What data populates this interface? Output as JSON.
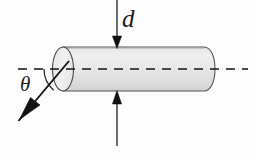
{
  "figure": {
    "background_color": "#fdfdfd",
    "width": 257,
    "height": 158
  },
  "labels": {
    "diameter": "d",
    "angle": "θ"
  },
  "icons": {
    "down_arrow": "arrow-down-icon",
    "up_arrow": "arrow-up-icon",
    "diagonal_arrow": "arrow-diagonal-icon",
    "axis": "dashed-axis-line-icon",
    "angle_arc": "angle-arc-icon",
    "cylinder": "cylinder-shape-icon"
  },
  "colors": {
    "stroke": "#1b1b1b",
    "cylinder_fill_light": "#eeeeee",
    "cylinder_fill_mid": "#e2e2e2",
    "cylinder_fill_dark": "#d3d3d3",
    "cap_fill": "#ededed",
    "background": "#fdfdfd"
  },
  "geometry": {
    "axis_y": 69,
    "axis_x_start": 18,
    "axis_x_end": 248,
    "cylinder_left_x": 53,
    "cylinder_right_x": 214,
    "cylinder_top_y": 47,
    "cylinder_bottom_y": 91,
    "cap_center_x": 63,
    "cap_rx": 10,
    "cap_ry": 22,
    "top_arrow_x": 117,
    "top_arrow_y_start": 0,
    "top_arrow_y_end": 47,
    "bottom_arrow_x": 117,
    "bottom_arrow_y_start": 145,
    "bottom_arrow_y_end": 92,
    "diagonal_start_x": 68,
    "diagonal_start_y": 62,
    "diagonal_end_x": 18,
    "diagonal_end_y": 121,
    "angle_arc_radius": 28
  }
}
